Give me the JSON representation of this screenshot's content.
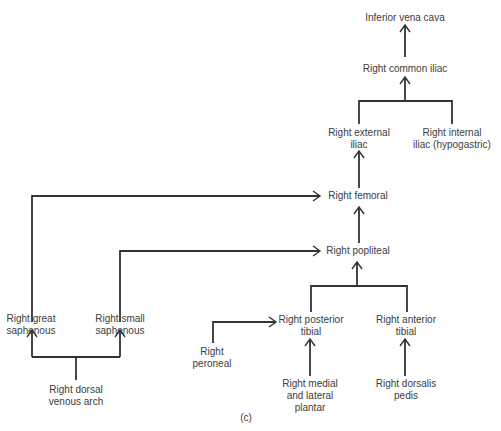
{
  "diagram": {
    "caption": "(c)",
    "nodes": {
      "ivc": {
        "lines": [
          "Inferior vena cava"
        ]
      },
      "common_iliac": {
        "lines": [
          "Right common iliac"
        ]
      },
      "external_iliac": {
        "lines": [
          "Right external",
          "iliac"
        ]
      },
      "internal_iliac": {
        "lines": [
          "Right internal",
          "iliac (hypogastric)"
        ]
      },
      "femoral": {
        "lines": [
          "Right femoral"
        ]
      },
      "popliteal": {
        "lines": [
          "Right popliteal"
        ]
      },
      "posterior_tibial": {
        "lines": [
          "Right posterior",
          "tibial"
        ]
      },
      "anterior_tibial": {
        "lines": [
          "Right anterior",
          "tibial"
        ]
      },
      "peroneal": {
        "lines": [
          "Right",
          "peroneal"
        ]
      },
      "medial_lateral_plantar": {
        "lines": [
          "Right medial",
          "and lateral",
          "plantar"
        ]
      },
      "dorsalis_pedis": {
        "lines": [
          "Right dorsalis",
          "pedis"
        ]
      },
      "great_saphenous": {
        "lines": [
          "Right great",
          "saphenous"
        ]
      },
      "small_saphenous": {
        "lines": [
          "Right small",
          "saphenous"
        ]
      },
      "dorsal_venous_arch": {
        "lines": [
          "Right dorsal",
          "venous arch"
        ]
      }
    },
    "edges": [
      {
        "from": "common_iliac",
        "to": "ivc"
      },
      {
        "from": "external_iliac",
        "to": "common_iliac"
      },
      {
        "from": "internal_iliac",
        "to": "common_iliac"
      },
      {
        "from": "femoral",
        "to": "external_iliac"
      },
      {
        "from": "great_saphenous",
        "to": "femoral"
      },
      {
        "from": "popliteal",
        "to": "femoral"
      },
      {
        "from": "small_saphenous",
        "to": "popliteal"
      },
      {
        "from": "posterior_tibial",
        "to": "popliteal"
      },
      {
        "from": "anterior_tibial",
        "to": "popliteal"
      },
      {
        "from": "peroneal",
        "to": "posterior_tibial"
      },
      {
        "from": "medial_lateral_plantar",
        "to": "posterior_tibial"
      },
      {
        "from": "dorsalis_pedis",
        "to": "anterior_tibial"
      },
      {
        "from": "dorsal_venous_arch",
        "to": "great_saphenous"
      },
      {
        "from": "dorsal_venous_arch",
        "to": "small_saphenous"
      }
    ]
  }
}
